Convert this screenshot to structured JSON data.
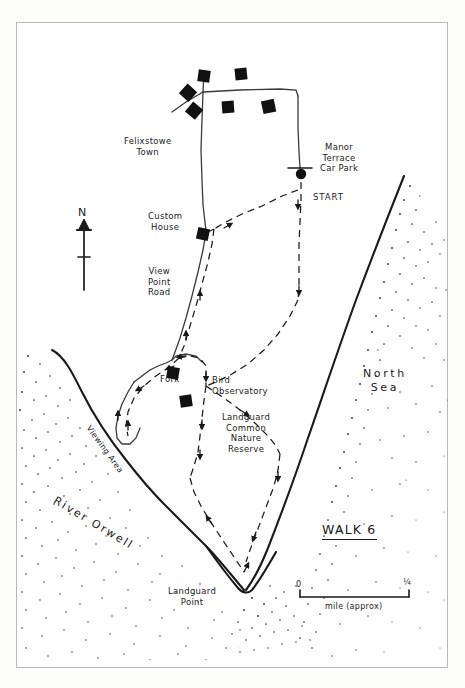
{
  "document": {
    "type": "hand-drawn walking route map",
    "title": "WALK 6"
  },
  "labels": {
    "felixstowe_town": "Felixstowe\nTown",
    "custom_house": "Custom\nHouse",
    "view_point_road": "View\nPoint\nRoad",
    "manor_terrace_car_park": "Manor\nTerrace\nCar Park",
    "start": "START",
    "fork": "Fork",
    "bird_observatory": "Bird\nObservatory",
    "landguard_common": "Landguard\nCommon\nNature\nReserve",
    "landguard_point": "Landguard\nPoint",
    "viewing_area": "Viewing Area",
    "river_orwell": "River Orwell",
    "north_sea": "North\nSea",
    "walk_title": "WALK 6",
    "compass_north": "N"
  },
  "scale_bar": {
    "start_label": "0",
    "end_label": "¼",
    "caption": "mile (approx)"
  },
  "legend_meaning": {
    "solid_line": "road",
    "dashed_line": "walking route",
    "black_square": "building",
    "filled_dot": "start point",
    "stipple": "water"
  },
  "colors": {
    "ink": "#1a1a1a",
    "paper": "#ffffff",
    "frame": "#b9b9b9"
  }
}
